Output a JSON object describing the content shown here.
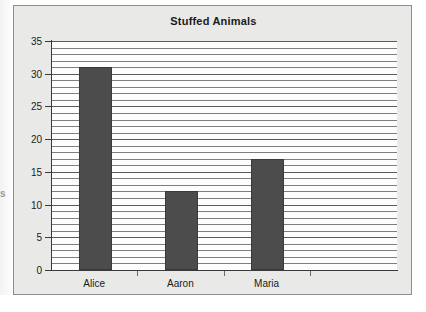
{
  "chart_data": {
    "type": "bar",
    "title": "Stuffed Animals",
    "categories": [
      "Alice",
      "Aaron",
      "Maria"
    ],
    "values": [
      31,
      12,
      17
    ],
    "xlabel": "",
    "ylabel": "",
    "ylim": [
      0,
      35
    ],
    "y_ticks": [
      0,
      5,
      10,
      15,
      20,
      25,
      30,
      35
    ],
    "y_tick_labels": [
      "0",
      "5",
      "10",
      "15",
      "20",
      "25",
      "30",
      "35"
    ],
    "grid": true,
    "grid_interval": 1,
    "legend": null,
    "bar_color": "#4c4c4c",
    "plot_background": "#fdfdfd",
    "chart_background": "#e9e9e7"
  },
  "artifacts": {
    "clipped_left_glyph": "s"
  }
}
